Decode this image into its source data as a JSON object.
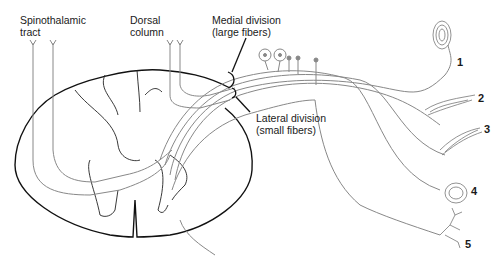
{
  "diagram": {
    "labels": {
      "spinothalamic": [
        "Spinothalamic",
        "tract"
      ],
      "dorsal_column": [
        "Dorsal",
        "column"
      ],
      "medial_division": [
        "Medial division",
        "(large fibers)"
      ],
      "lateral_division": [
        "Lateral division",
        "(small fibers)"
      ]
    },
    "receptors": [
      {
        "number": "1",
        "type": "lamellated-corpuscle"
      },
      {
        "number": "2",
        "type": "spindle-ending"
      },
      {
        "number": "3",
        "type": "spindle-ending"
      },
      {
        "number": "4",
        "type": "encapsulated-ending"
      },
      {
        "number": "5",
        "type": "free-nerve-ending"
      }
    ],
    "colors": {
      "outline": "#111111",
      "fiber": "#777777"
    }
  }
}
